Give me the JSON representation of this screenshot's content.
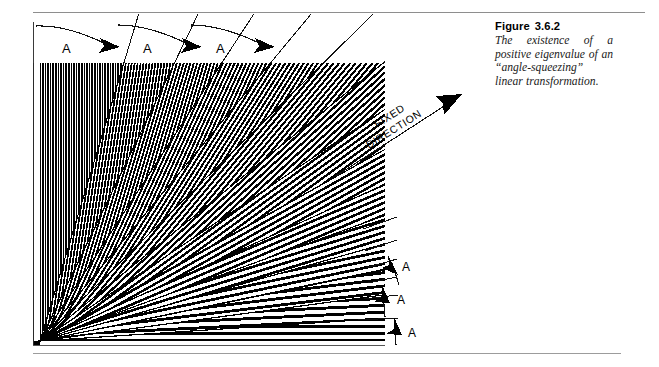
{
  "figure": {
    "label": "Figure",
    "number": "3.6.2",
    "caption": "The existence of a positive eigenvalue of an “angle-squeezing” linear transformation.",
    "caption_lines": [
      "The existence of a posi-",
      "tive eigenvalue of an “ an-",
      "gle-squeezing ” linear",
      "transformation."
    ]
  },
  "annotations": {
    "fixed_direction": {
      "line1": "FIXED",
      "line2": "DIRECTION"
    },
    "top_arcs": [
      {
        "label": "A"
      },
      {
        "label": "A"
      },
      {
        "label": "A"
      }
    ],
    "right_arrows": [
      {
        "label": "A"
      },
      {
        "label": "A"
      },
      {
        "label": "A"
      }
    ]
  },
  "colors": {
    "ink": "#000000",
    "rule": "#9a9a9a",
    "paper": "#ffffff"
  },
  "chart_data": {
    "type": "line",
    "xlabel": "",
    "ylabel": "",
    "frame": {
      "x": 33,
      "y": 63,
      "width": 352,
      "height": 282
    },
    "apex": {
      "x": 40,
      "y": 341
    },
    "hatch_bundles": 15,
    "fixed_direction_slope_deg": 27,
    "grid": false,
    "legend": "none"
  }
}
